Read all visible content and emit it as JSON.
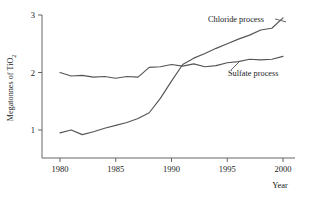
{
  "chart_data": {
    "type": "line",
    "title": "",
    "xlabel": "Year",
    "ylabel": "Megatonnes of TiO2",
    "ylabel_main": "Megatonnes of TiO",
    "ylabel_sub": "2",
    "xlim": [
      1979,
      2001
    ],
    "ylim": [
      0.55,
      3.05
    ],
    "xticks": [
      1980,
      1985,
      1990,
      1995,
      2000
    ],
    "xtick_labels": [
      "1980",
      "1985",
      "1990",
      "1995",
      "2000"
    ],
    "yticks": [
      1,
      2,
      3
    ],
    "ytick_labels": [
      "1",
      "2",
      "3"
    ],
    "grid": false,
    "legend_position": "inline-annotation",
    "line_color": "#555555",
    "background_color": "#ffffff",
    "series": [
      {
        "name": "Chloride process",
        "label": "Chloride process",
        "x": [
          1980,
          1981,
          1982,
          1983,
          1984,
          1985,
          1986,
          1987,
          1988,
          1989,
          1990,
          1991,
          1992,
          1993,
          1994,
          1995,
          1996,
          1997,
          1998,
          1999,
          2000
        ],
        "values": [
          0.95,
          1.0,
          0.92,
          0.97,
          1.03,
          1.08,
          1.13,
          1.2,
          1.3,
          1.55,
          1.85,
          2.14,
          2.25,
          2.33,
          2.42,
          2.5,
          2.58,
          2.65,
          2.74,
          2.77,
          2.95
        ]
      },
      {
        "name": "Sulfate process",
        "label": "Sulfate process",
        "x": [
          1980,
          1981,
          1982,
          1983,
          1984,
          1985,
          1986,
          1987,
          1988,
          1989,
          1990,
          1991,
          1992,
          1993,
          1994,
          1995,
          1996,
          1997,
          1998,
          1999,
          2000
        ],
        "values": [
          2.0,
          1.94,
          1.95,
          1.92,
          1.93,
          1.9,
          1.93,
          1.92,
          2.09,
          2.1,
          2.14,
          2.11,
          2.15,
          2.1,
          2.12,
          2.17,
          2.19,
          2.23,
          2.22,
          2.23,
          2.28
        ]
      }
    ],
    "annotations": [
      {
        "text": "Chloride process",
        "anchor_x": 1994,
        "anchor_y": 2.9
      },
      {
        "text": "Sulfate process",
        "anchor_x": 1995.5,
        "anchor_y": 2.05
      }
    ]
  }
}
